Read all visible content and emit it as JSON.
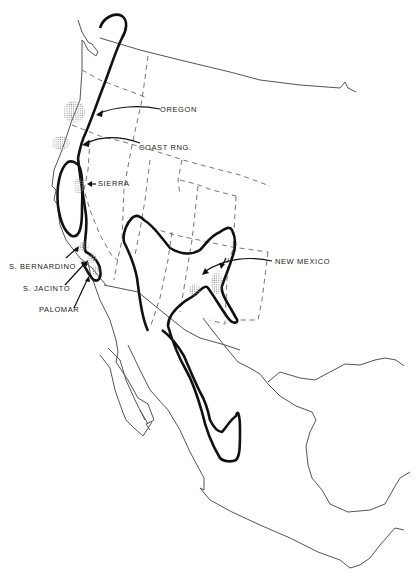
{
  "map": {
    "type": "distribution map",
    "region": "Western North America",
    "background_color": "#ffffff",
    "line_color": "#111111",
    "stipple_color": "#999999"
  },
  "labels": {
    "oregon": "OREGON",
    "coast_rng": "COAST RNG.",
    "sierra": "SIERRA",
    "s_bernardino": "S. BERNARDINO",
    "s_jacinto": "S. JACINTO",
    "palomar": "PALOMAR",
    "new_mexico": "NEW MEXICO"
  },
  "legend_elements": {
    "heavy_outline": "range boundary",
    "stippled_patches": "locality populations",
    "dashed_lines": "state boundaries"
  }
}
